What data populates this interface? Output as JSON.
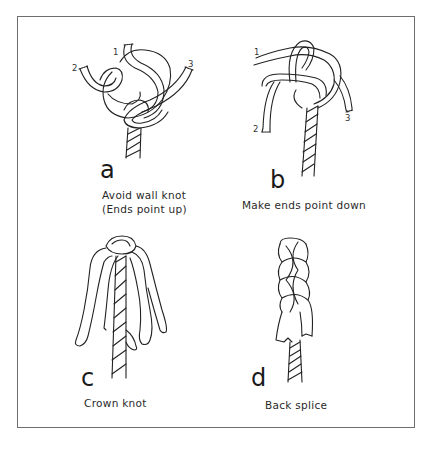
{
  "figure": {
    "panels": [
      {
        "id": "a",
        "letter": "a",
        "caption_line1": "Avoid wall knot",
        "caption_line2": "(Ends point up)",
        "strand_labels": [
          "1",
          "2",
          "3"
        ]
      },
      {
        "id": "b",
        "letter": "b",
        "caption_line1": "Make ends point down",
        "strand_labels": [
          "1",
          "2",
          "3"
        ]
      },
      {
        "id": "c",
        "letter": "c",
        "caption_line1": "Crown knot"
      },
      {
        "id": "d",
        "letter": "d",
        "caption_line1": "Back splice"
      }
    ],
    "colors": {
      "line": "#222222",
      "background": "#ffffff",
      "frame": "#6e6e6e"
    }
  }
}
